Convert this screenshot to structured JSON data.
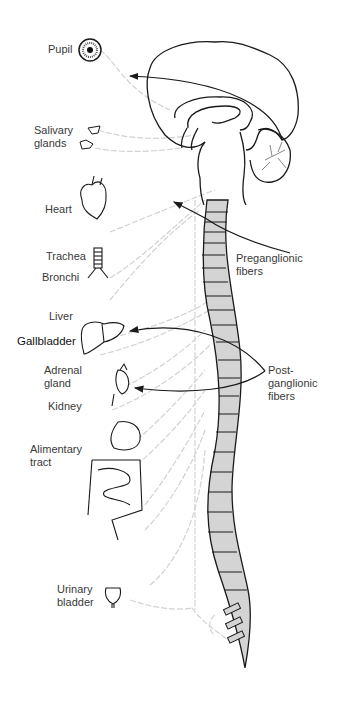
{
  "organs": [
    {
      "id": "pupil",
      "label": "Pupil"
    },
    {
      "id": "salivary",
      "label_line1": "Salivary",
      "label_line2": "glands"
    },
    {
      "id": "heart",
      "label": "Heart"
    },
    {
      "id": "trachea",
      "label": "Trachea"
    },
    {
      "id": "bronchi",
      "label": "Bronchi"
    },
    {
      "id": "liver",
      "label": "Liver"
    },
    {
      "id": "gallbladder",
      "label": "Gallbladder"
    },
    {
      "id": "adrenal",
      "label_line1": "Adrenal",
      "label_line2": "gland"
    },
    {
      "id": "kidney",
      "label": "Kidney"
    },
    {
      "id": "alimentary",
      "label_line1": "Alimentary",
      "label_line2": "tract"
    },
    {
      "id": "bladder",
      "label_line1": "Urinary",
      "label_line2": "bladder"
    }
  ],
  "callouts": {
    "preganglionic": {
      "line1": "Preganglionic",
      "line2": "fibers"
    },
    "postganglionic": {
      "line1": "Post-",
      "line2": "ganglionic",
      "line3": "fibers"
    }
  },
  "colors": {
    "outline": "#1a1a1a",
    "spinal_fill": "#d4d4d4",
    "nerve": "#cfcfcf",
    "text": "#3a3a3a"
  }
}
